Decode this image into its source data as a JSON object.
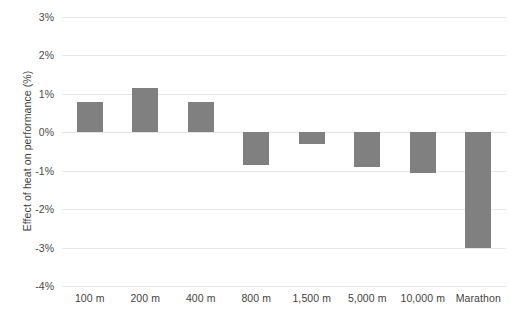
{
  "chart_data": {
    "type": "bar",
    "title": "",
    "subtitle": "",
    "xlabel": "",
    "ylabel": "Effect of heat on performance (%)",
    "categories": [
      "100 m",
      "200 m",
      "400 m",
      "800 m",
      "1,500 m",
      "5,000 m",
      "10,000 m",
      "Marathon"
    ],
    "values": [
      0.8,
      1.15,
      0.8,
      -0.85,
      -0.3,
      -0.9,
      -1.05,
      -3.0
    ],
    "ylim": [
      -4,
      3
    ],
    "y_tick_values": [
      3,
      2,
      1,
      0,
      -1,
      -2,
      -3,
      -4
    ],
    "y_tick_labels": [
      "3%",
      "2%",
      "1%",
      "0%",
      "-1%",
      "-2%",
      "-3%",
      "-4%"
    ],
    "grid": true,
    "legend": false,
    "bar_color": "#808080",
    "gridline_color": "#e8e8ea",
    "background_color": "#ffffff",
    "text_color": "#3f3f3f"
  }
}
